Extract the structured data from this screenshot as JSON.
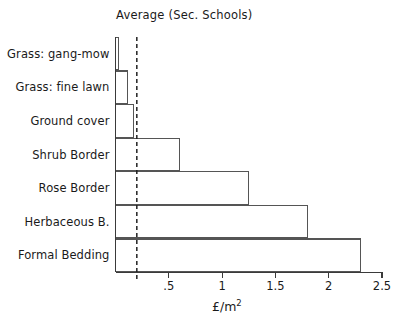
{
  "chart_data": {
    "type": "bar",
    "orientation": "horizontal",
    "title": "Average (Sec. Schools)",
    "xlabel": "£/m",
    "xlabel_superscript": "2",
    "ylabel": "",
    "categories": [
      "Grass: gang-mow",
      "Grass: fine lawn",
      "Ground cover",
      "Shrub Border",
      "Rose Border",
      "Herbaceous B.",
      "Formal Bedding"
    ],
    "values": [
      0.03,
      0.11,
      0.17,
      0.6,
      1.25,
      1.8,
      2.3
    ],
    "xlim": [
      0,
      2.5
    ],
    "xticks": [
      0.5,
      1,
      1.5,
      2,
      2.5
    ],
    "xticklabels": [
      ".5",
      "1",
      "1.5",
      "2",
      "2.5"
    ],
    "grid": false,
    "legend": null,
    "annotations": [
      {
        "name": "average-reference-line",
        "style": "dashed-vertical",
        "value": 0.2
      }
    ],
    "series": [
      {
        "name": "Average (Sec. Schools)",
        "values": [
          0.03,
          0.11,
          0.17,
          0.6,
          1.25,
          1.8,
          2.3
        ]
      }
    ],
    "colors": {
      "bar_stroke": "#555555",
      "bar_fill": "none",
      "axis": "#3a3a3a",
      "reference_line": "#222222",
      "text": "#1a1a1a",
      "background": "#ffffff"
    }
  }
}
